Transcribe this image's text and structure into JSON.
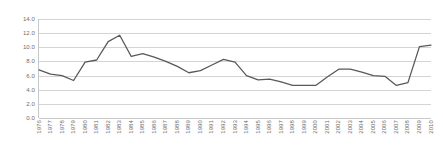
{
  "chart_data": {
    "type": "line",
    "title": "",
    "subtitle": "",
    "xlabel": "",
    "ylabel": "",
    "ylim": [
      0.0,
      14.0
    ],
    "ytick_step": 2.0,
    "yticks": [
      "14.0",
      "12.0",
      "10.0",
      "8.0",
      "6.0",
      "4.0",
      "2.0",
      "0.0"
    ],
    "grid": "horizontal",
    "legend": "none",
    "line_color": "#595959",
    "gridline_color": "#d4d4d4",
    "axis_color": "#c9c9c9",
    "tick_label_color": "#6d6d6d",
    "x_label_rotation": "-90",
    "categories": [
      "1976",
      "1977",
      "1978",
      "1979",
      "1980",
      "1981",
      "1982",
      "1983",
      "1984",
      "1985",
      "1986",
      "1987",
      "1988",
      "1989",
      "1990",
      "1991",
      "1992",
      "1993",
      "1994",
      "1995",
      "1996",
      "1997",
      "1998",
      "1999",
      "2000",
      "2001",
      "2002",
      "2003",
      "2004",
      "2005",
      "2006",
      "2007",
      "2008",
      "2009",
      "2010"
    ],
    "series": [
      {
        "name": "",
        "values": [
          6.8,
          6.2,
          6.0,
          5.3,
          7.9,
          8.2,
          10.8,
          11.7,
          8.7,
          9.1,
          8.6,
          8.0,
          7.3,
          6.4,
          6.7,
          7.5,
          8.3,
          7.9,
          6.0,
          5.4,
          5.5,
          5.1,
          4.6,
          4.6,
          4.6,
          5.8,
          6.9,
          6.9,
          6.5,
          6.0,
          5.9,
          4.6,
          5.0,
          10.1,
          10.3
        ]
      }
    ]
  }
}
